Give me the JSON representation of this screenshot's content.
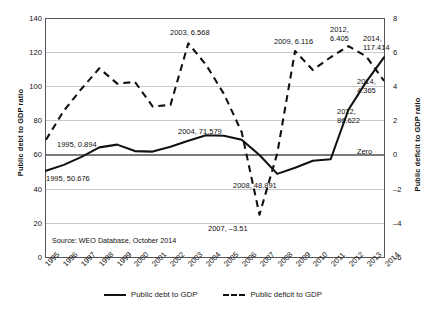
{
  "chart_data": {
    "type": "line",
    "title": "",
    "source_note": "Source: WEO Database, October 2014",
    "x": [
      1995,
      1996,
      1997,
      1998,
      1999,
      2000,
      2001,
      2002,
      2003,
      2004,
      2005,
      2006,
      2007,
      2008,
      2009,
      2010,
      2011,
      2012,
      2013,
      2014
    ],
    "xlabel": "",
    "ylabel_left": "Public debt to GDP ratio",
    "ylabel_right": "Public deficit to GDP ratio",
    "ylim_left": [
      0,
      140
    ],
    "ylim_right": [
      -6,
      8
    ],
    "yticks_left": [
      "140",
      "120",
      "100",
      "80",
      "60",
      "40",
      "20",
      "0"
    ],
    "yticks_right": [
      "8",
      "6",
      "4",
      "2",
      "0",
      "–2",
      "–4",
      "–6"
    ],
    "grid": true,
    "legend_position": "bottom-center",
    "zero_line_label": "Zero",
    "series": [
      {
        "name": "Public debt to GDP",
        "axis": "left",
        "style": "solid",
        "values": [
          50.676,
          54.2,
          58.9,
          64.5,
          66.1,
          62.3,
          62.0,
          64.8,
          68.4,
          71.579,
          71.3,
          69.0,
          60.0,
          48.891,
          52.5,
          56.6,
          57.5,
          86.622,
          103.0,
          117.414
        ]
      },
      {
        "name": "Public deficit to GDP",
        "axis": "right",
        "style": "dashed",
        "values": [
          0.894,
          2.6,
          3.9,
          5.1,
          4.2,
          4.3,
          2.85,
          2.95,
          6.568,
          5.3,
          3.6,
          1.35,
          -3.51,
          0.1,
          6.116,
          5.0,
          5.75,
          6.405,
          5.8,
          4.365
        ]
      }
    ],
    "annotations": [
      {
        "id": "a1995-deficit",
        "text": "1995, 0.894"
      },
      {
        "id": "a1995-debt",
        "text": "1995, 50.676"
      },
      {
        "id": "a2003",
        "text": "2003, 6.568"
      },
      {
        "id": "a2004",
        "text": "2004, 71.579"
      },
      {
        "id": "a2007",
        "text": "2007, –3.51"
      },
      {
        "id": "a2008",
        "text": "2008, 48.891"
      },
      {
        "id": "a2009",
        "text": "2009, 6.116"
      },
      {
        "id": "a2012-deficit",
        "text": "2012,\n6.405"
      },
      {
        "id": "a2014-debt",
        "text": "2014,\n117.414"
      },
      {
        "id": "a2014-deficit",
        "text": "2014,\n4.365"
      },
      {
        "id": "a2012-debt",
        "text": "2012,\n86.622"
      }
    ],
    "xtick_labels": [
      "1995",
      "1996",
      "1997",
      "1998",
      "1999",
      "2000",
      "2001",
      "2002",
      "2003",
      "2004",
      "2005",
      "2006",
      "2007",
      "2008",
      "2009",
      "2010",
      "2011",
      "2012",
      "2013",
      "2014"
    ]
  },
  "legend": {
    "items": [
      {
        "label": "Public debt to GDP",
        "style": "solid"
      },
      {
        "label": "Public deficit to GDP",
        "style": "dashed"
      }
    ]
  },
  "colors": {
    "line": "#111111",
    "grid": "#c9c9c9",
    "zero": "#7a7a7a",
    "frame": "#555555"
  }
}
